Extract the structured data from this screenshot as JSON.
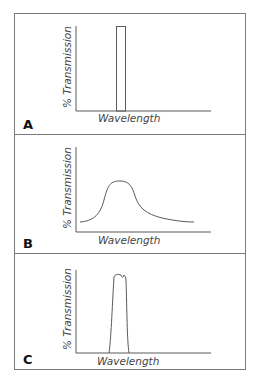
{
  "panels": [
    {
      "id": "A",
      "label": "A",
      "ylabel": "% Transmission",
      "xlabel": "Wavelength",
      "shape": "narrow rectangular passband"
    },
    {
      "id": "B",
      "label": "B",
      "ylabel": "% Transmission",
      "xlabel": "Wavelength",
      "shape": "broad bell-shaped curve with long tail"
    },
    {
      "id": "C",
      "label": "C",
      "ylabel": "% Transmission",
      "xlabel": "Wavelength",
      "shape": "steep-sided passband with rippled top"
    }
  ],
  "colors": {
    "line": "#5a5a5a",
    "frame": "#7a7a7a",
    "text": "#444444"
  }
}
